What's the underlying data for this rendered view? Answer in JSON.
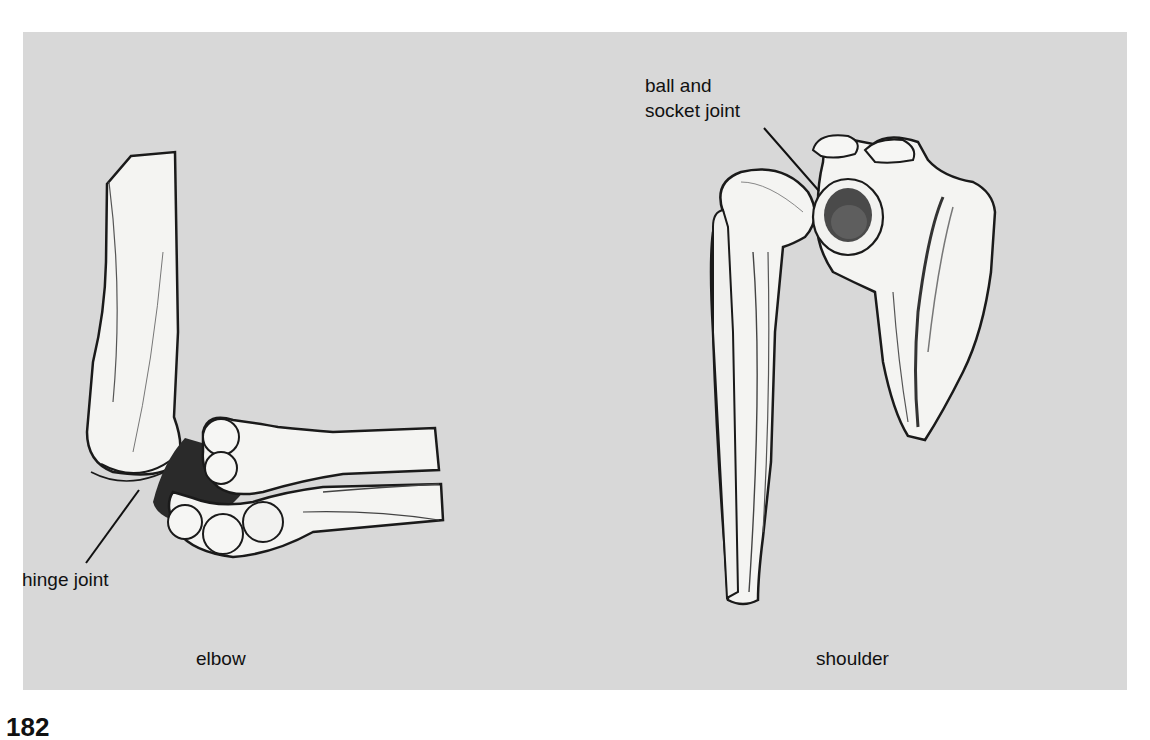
{
  "figure": {
    "background_color": "#d8d8d8",
    "bone_color": "#f4f4f2",
    "outline_color": "#1a1a1a",
    "labels": {
      "hinge_joint": "hinge joint",
      "ball_socket_line1": "ball and",
      "ball_socket_line2": "socket joint",
      "elbow": "elbow",
      "shoulder": "shoulder"
    }
  },
  "page": {
    "number_fragment": "182"
  }
}
